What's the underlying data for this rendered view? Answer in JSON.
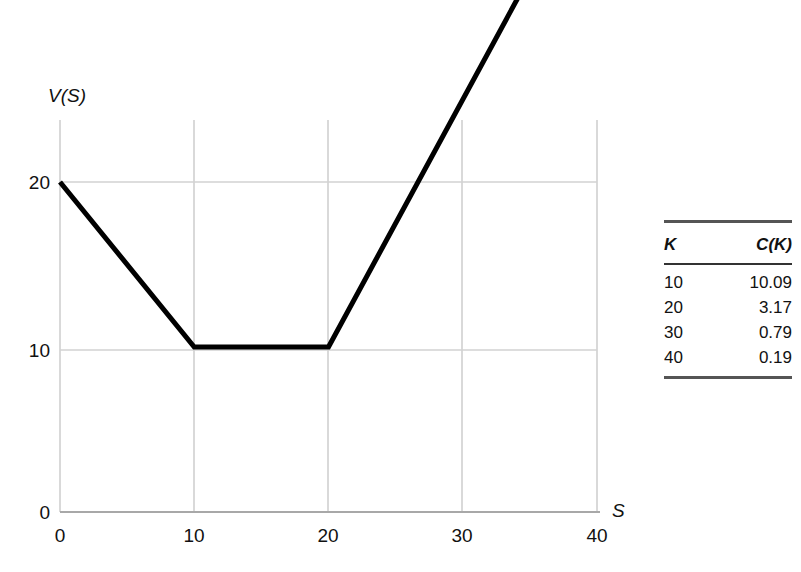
{
  "chart_data": {
    "type": "line",
    "title": "",
    "xlabel": "S",
    "ylabel": "V(S)",
    "xlim": [
      0,
      40
    ],
    "ylim": [
      0,
      40
    ],
    "grid": true,
    "legend": "none",
    "x_ticks": [
      "0",
      "10",
      "20",
      "30",
      "40"
    ],
    "x_tick_values": [
      0,
      10,
      20,
      30,
      40
    ],
    "y_ticks": [
      "0",
      "10",
      "20"
    ],
    "y_tick_values": [
      0,
      10,
      20
    ],
    "series": [
      {
        "name": "V(S)",
        "color": "#000000",
        "linewidth": 5,
        "points": [
          {
            "x": 0,
            "y": 20
          },
          {
            "x": 10,
            "y": 10
          },
          {
            "x": 20,
            "y": 10
          },
          {
            "x": 40,
            "y": 40
          }
        ]
      }
    ]
  },
  "axis": {
    "y_label": "V(S)",
    "x_label": "S",
    "y_tick_0": "0",
    "y_tick_10": "10",
    "y_tick_20": "20",
    "x_tick_0": "0",
    "x_tick_10": "10",
    "x_tick_20": "20",
    "x_tick_30": "30",
    "x_tick_40": "40"
  },
  "table": {
    "headers": [
      "K",
      "C(K)"
    ],
    "rows": [
      {
        "k": "10",
        "ck": "10.09"
      },
      {
        "k": "20",
        "ck": "3.17"
      },
      {
        "k": "30",
        "ck": "0.79"
      },
      {
        "k": "40",
        "ck": "0.19"
      }
    ]
  },
  "colors": {
    "curve": "#000000",
    "grid": "#cccccc",
    "axis": "#9a9a9a",
    "text": "#111111",
    "rule_thick": "#555555",
    "rule_thin": "#333333"
  }
}
